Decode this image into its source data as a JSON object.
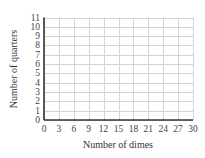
{
  "chart_data": {
    "type": "scatter",
    "title": "",
    "xlabel": "Number of dimes",
    "ylabel": "Number of quarters",
    "xlim": [
      0,
      30
    ],
    "ylim": [
      0,
      11
    ],
    "x_ticks": [
      0,
      3,
      6,
      9,
      12,
      15,
      18,
      21,
      24,
      27,
      30
    ],
    "y_ticks": [
      0,
      1,
      2,
      3,
      4,
      5,
      6,
      7,
      8,
      9,
      10,
      11
    ],
    "x_grid_step": 3,
    "y_grid_step": 1,
    "grid": true,
    "legend": null,
    "series": []
  },
  "colors": {
    "grid": "#d4d4d4",
    "axis": "#333333",
    "text": "#444444"
  }
}
